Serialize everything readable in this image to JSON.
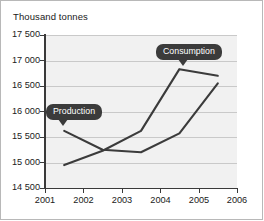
{
  "chart_data": {
    "type": "line",
    "title": "Thousand tonnes",
    "xlabel": "",
    "ylabel": "Thousand tonnes",
    "xlim": [
      2001,
      2006
    ],
    "ylim": [
      14500,
      17500
    ],
    "grid": true,
    "legend": "annotated-callouts",
    "x": [
      2001.5,
      2002.5,
      2003.5,
      2004.5,
      2005.5
    ],
    "xtick_labels": [
      "2001",
      "2002",
      "2003",
      "2004",
      "2005",
      "2006"
    ],
    "xticks": [
      2001,
      2002,
      2003,
      2004,
      2005,
      2006
    ],
    "ytick_labels": [
      "17 500",
      "17 000",
      "16 500",
      "16 000",
      "15 500",
      "15 000",
      "14 500"
    ],
    "yticks": [
      17500,
      17000,
      16500,
      16000,
      15500,
      15000,
      14500
    ],
    "series": [
      {
        "name": "Production",
        "label": "Production",
        "color": "#3b3b3b",
        "values": [
          15620,
          15250,
          15200,
          15570,
          16550
        ]
      },
      {
        "name": "Consumption",
        "label": "Consumption",
        "color": "#3b3b3b",
        "values": [
          14950,
          15230,
          15620,
          16830,
          16700
        ]
      }
    ],
    "annotations": [
      {
        "text": "Production",
        "points_to_series": "Production",
        "points_to_index": 0
      },
      {
        "text": "Consumption",
        "points_to_series": "Consumption",
        "points_to_index": 3
      }
    ],
    "colors": {
      "plot_background": "#f1f1f1",
      "gridline": "#c9c9c9",
      "axis": "#3a3a3a",
      "line": "#3b3b3b",
      "callout_background": "#3b3b3b",
      "callout_text": "#ffffff",
      "frame_border": "#b8b8b8",
      "page_background": "#ffffff",
      "text": "#1a1a1a"
    }
  }
}
